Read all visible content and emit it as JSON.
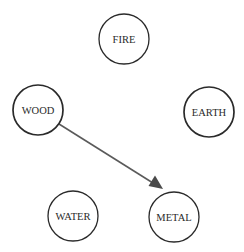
{
  "diagram": {
    "type": "directed-graph",
    "nodes": [
      {
        "id": "fire",
        "label": "FIRE",
        "cx": 124,
        "cy": 39,
        "r": 25
      },
      {
        "id": "wood",
        "label": "WOOD",
        "cx": 38,
        "cy": 110,
        "r": 25
      },
      {
        "id": "earth",
        "label": "EARTH",
        "cx": 209,
        "cy": 112,
        "r": 25
      },
      {
        "id": "water",
        "label": "WATER",
        "cx": 73,
        "cy": 216,
        "r": 25
      },
      {
        "id": "metal",
        "label": "METAL",
        "cx": 174,
        "cy": 217,
        "r": 25
      }
    ],
    "edges": [
      {
        "from": "wood",
        "to": "metal",
        "x1": 59,
        "y1": 124,
        "x2": 163,
        "y2": 189
      }
    ],
    "colors": {
      "node_stroke": "#2a2a2a",
      "edge": "#5a5a5a",
      "arrow_fill": "#4a4a4a",
      "background": "#ffffff"
    }
  }
}
